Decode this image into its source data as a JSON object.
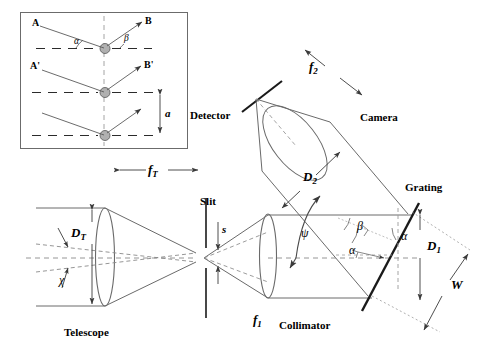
{
  "figure": {
    "background_color": "#ffffff",
    "line_color": "#4d4d4d",
    "dark_line_color": "#1a1a1a",
    "node_fill": "#b3b3b3",
    "width": 486,
    "height": 356
  },
  "inset": {
    "name": "grating-groove-diffraction-inset",
    "labels": {
      "incident_upper": "A",
      "diffracted_upper": "B",
      "incident_middle": "A'",
      "diffracted_middle": "B'",
      "angle_in": "α",
      "angle_out": "β",
      "groove_spacing": "a"
    }
  },
  "components": {
    "detector": "Detector",
    "camera": "Camera",
    "grating": "Grating",
    "collimator": "Collimator",
    "slit": "Slit",
    "telescope": "Telescope"
  },
  "dimensions": {
    "telescope_focal": "f",
    "telescope_focal_sub": "T",
    "collimator_focal": "f",
    "collimator_focal_sub": "1",
    "camera_focal": "f",
    "camera_focal_sub": "2",
    "telescope_diameter": "D",
    "telescope_diameter_sub": "T",
    "camera_diameter": "D",
    "camera_diameter_sub": "2",
    "beam_diameter": "D",
    "beam_diameter_sub": "1",
    "grating_width": "W",
    "slit_width": "s",
    "field_angle": "χ",
    "grating_angle_in": "α",
    "grating_angle_out": "β",
    "grating_normal_angle": "α",
    "deviation_angle": "ψ"
  }
}
